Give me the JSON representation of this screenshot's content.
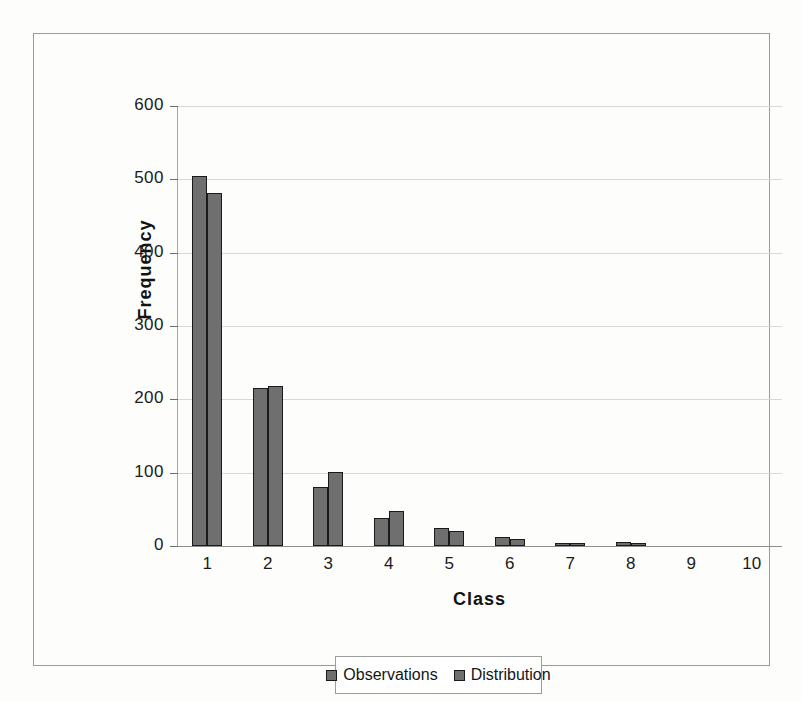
{
  "chart_data": {
    "type": "bar",
    "title": "",
    "xlabel": "Class",
    "ylabel": "Frequency",
    "categories": [
      "1",
      "2",
      "3",
      "4",
      "5",
      "6",
      "7",
      "8",
      "9",
      "10"
    ],
    "series": [
      {
        "name": "Observations",
        "color": "#6f6f6f",
        "values": [
          505,
          216,
          80,
          38,
          24,
          12,
          4,
          5,
          0,
          0
        ]
      },
      {
        "name": "Distribution",
        "color": "#6f6f6f",
        "values": [
          481,
          218,
          101,
          48,
          21,
          10,
          4,
          2,
          0,
          0
        ]
      }
    ],
    "ylim": [
      0,
      600
    ],
    "y_ticks": [
      "0",
      "100",
      "200",
      "300",
      "400",
      "500",
      "600"
    ],
    "y_tick_values": [
      0,
      100,
      200,
      300,
      400,
      500,
      600
    ],
    "grid": true,
    "legend_position": "bottom"
  },
  "legend": {
    "entries": [
      {
        "label": "Observations",
        "swatch": "legend-swatch-observations"
      },
      {
        "label": "Distribution",
        "swatch": "legend-swatch-distribution"
      }
    ]
  },
  "colors": {
    "bar_fill": "#6f6f6f",
    "bar_stroke": "#1a1a1a",
    "gridline": "#d8d8d6",
    "axis": "#8e8e8c",
    "text": "#1b1b1b",
    "page_background": "#fdfdfb"
  }
}
